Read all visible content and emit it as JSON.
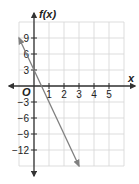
{
  "chart_data": {
    "type": "line",
    "title": "",
    "xlabel": "x",
    "ylabel": "f(x)",
    "origin_label": "O",
    "xlim": [
      -1,
      6
    ],
    "ylim": [
      -15,
      12
    ],
    "x_ticks": [
      1,
      2,
      3,
      4,
      5
    ],
    "x_tick_labels": [
      "1",
      "2",
      "3",
      "4",
      "5"
    ],
    "y_ticks": [
      9,
      6,
      3,
      -3,
      -6,
      -9,
      -12
    ],
    "y_tick_labels": [
      "9",
      "6",
      "3",
      "−3",
      "−6",
      "−9",
      "−12"
    ],
    "grid": true,
    "grid_x_step": 1,
    "grid_y_step": 3,
    "series": [
      {
        "name": "f(x)",
        "equation": "f(x) = 3 - 6x",
        "x": [
          -1,
          3
        ],
        "y": [
          9,
          -15
        ],
        "color": "#808080",
        "arrows": "both"
      }
    ],
    "y_intercept": 3,
    "legend": null
  },
  "colors": {
    "axis": "#333333",
    "grid": "#d4d4d4",
    "line": "#808080"
  }
}
